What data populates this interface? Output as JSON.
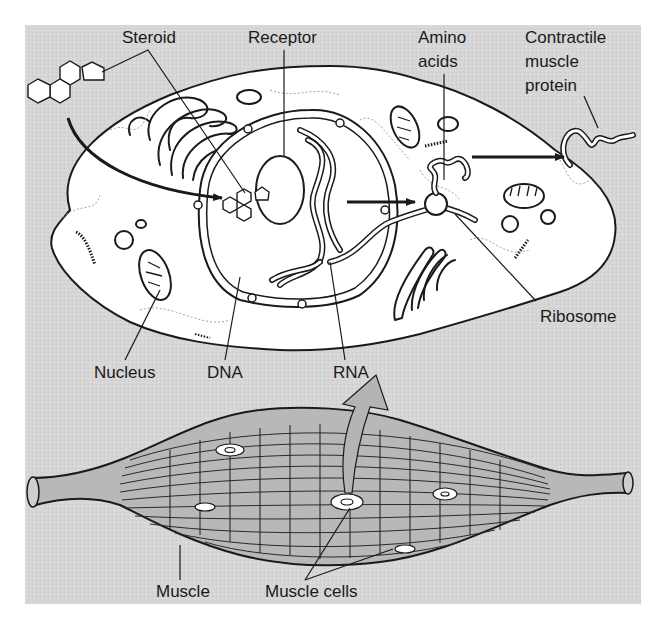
{
  "diagram": {
    "colors": {
      "background_panel": "#d6d6d6",
      "cell_fill": "#ffffff",
      "ink": "#1a1a1a",
      "muscle_fill": "#bdbdbd",
      "arrow_fill": "#b4b4b4"
    },
    "labels": {
      "steroid": "Steroid",
      "receptor": "Receptor",
      "amino_acids_line1": "Amino",
      "amino_acids_line2": "acids",
      "contractile_line1": "Contractile",
      "contractile_line2": "muscle",
      "contractile_line3": "protein",
      "ribosome": "Ribosome",
      "nucleus": "Nucleus",
      "dna": "DNA",
      "rna": "RNA",
      "muscle": "Muscle",
      "muscle_cells": "Muscle cells"
    },
    "nodes": [
      {
        "id": "steroid",
        "label": "Steroid"
      },
      {
        "id": "receptor",
        "label": "Receptor"
      },
      {
        "id": "nucleus",
        "label": "Nucleus"
      },
      {
        "id": "dna",
        "label": "DNA"
      },
      {
        "id": "rna",
        "label": "RNA"
      },
      {
        "id": "ribosome",
        "label": "Ribosome"
      },
      {
        "id": "amino_acids",
        "label": "Amino acids"
      },
      {
        "id": "contractile_protein",
        "label": "Contractile muscle protein"
      },
      {
        "id": "muscle",
        "label": "Muscle"
      },
      {
        "id": "muscle_cells",
        "label": "Muscle cells"
      }
    ],
    "edges": [
      {
        "from": "steroid",
        "to": "receptor",
        "type": "arrow",
        "note": "steroid enters cell and nucleus"
      },
      {
        "from": "dna",
        "to": "ribosome",
        "type": "arrow",
        "note": "RNA carries message to ribosome"
      },
      {
        "from": "ribosome",
        "to": "contractile_protein",
        "type": "arrow"
      },
      {
        "from": "muscle_cells",
        "to": "nucleus",
        "type": "block-arrow",
        "note": "zoom from muscle cell to cell detail"
      }
    ]
  }
}
